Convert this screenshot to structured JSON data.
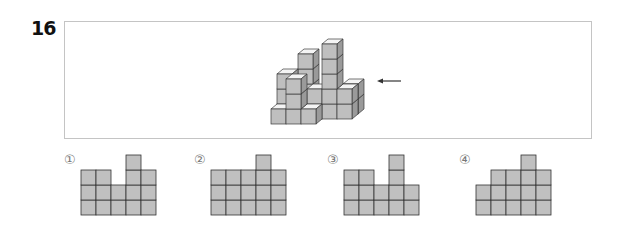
{
  "question": {
    "number": "16",
    "view_arrow": "left-arrow"
  },
  "colors": {
    "cube_front": "#bfbfbf",
    "cube_top": "#f4f4f4",
    "cube_side": "#9a9a9a",
    "cube_stroke": "#3a3a3a",
    "grid_fill": "#c0c0c0",
    "grid_stroke": "#333333",
    "box_border": "#c4c4c4"
  },
  "structure": {
    "description": "3D stack of unit cubes viewed obliquely; arrow indicates the viewing direction from the right side",
    "cubes": [
      {
        "x": 0,
        "y": 0,
        "z": 0
      },
      {
        "x": 1,
        "y": 0,
        "z": 0
      },
      {
        "x": 1,
        "y": 0,
        "z": 1
      },
      {
        "x": 1,
        "y": 0,
        "z": 2
      },
      {
        "x": 0,
        "y": 1,
        "z": 0
      },
      {
        "x": 0,
        "y": 1,
        "z": 1
      },
      {
        "x": 0,
        "y": 1,
        "z": 2
      },
      {
        "x": 1,
        "y": 2,
        "z": 0
      },
      {
        "x": 1,
        "y": 2,
        "z": 1
      },
      {
        "x": 1,
        "y": 2,
        "z": 2
      },
      {
        "x": 1,
        "y": 2,
        "z": 3
      },
      {
        "x": 2,
        "y": 0,
        "z": 0
      },
      {
        "x": 2,
        "y": 1,
        "z": 0
      },
      {
        "x": 2,
        "y": 1,
        "z": 1
      },
      {
        "x": 3,
        "y": 1,
        "z": 0
      },
      {
        "x": 3,
        "y": 1,
        "z": 1
      },
      {
        "x": 3,
        "y": 1,
        "z": 2
      },
      {
        "x": 3,
        "y": 1,
        "z": 3
      },
      {
        "x": 3,
        "y": 1,
        "z": 4
      },
      {
        "x": 4,
        "y": 1,
        "z": 0
      },
      {
        "x": 4,
        "y": 1,
        "z": 1
      },
      {
        "x": 4,
        "y": 2,
        "z": 0
      },
      {
        "x": 4,
        "y": 2,
        "z": 1
      }
    ]
  },
  "options": [
    {
      "label": "①",
      "columns": [
        3,
        3,
        2,
        4,
        3
      ]
    },
    {
      "label": "②",
      "columns": [
        3,
        3,
        3,
        4,
        3
      ]
    },
    {
      "label": "③",
      "columns": [
        3,
        3,
        2,
        4,
        2
      ]
    },
    {
      "label": "④",
      "columns": [
        2,
        3,
        3,
        4,
        3
      ]
    }
  ]
}
